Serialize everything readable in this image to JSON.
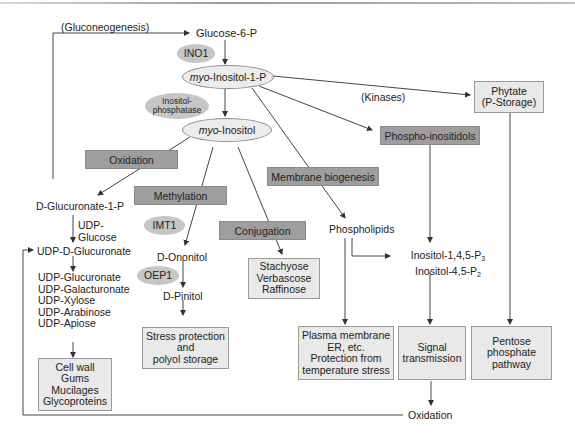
{
  "diagram": {
    "labels": {
      "gluconeogenesis": "(Gluconeogenesis)",
      "kinases": "(Kinases)"
    },
    "metabolites": {
      "glucose_6_p": "Glucose-6-P",
      "myo_inositol_1_p_prefix": "myo",
      "myo_inositol_1_p_suffix": "-Inositol-1-P",
      "myo_inositol_prefix": "myo",
      "myo_inositol_suffix": "-Inositol",
      "d_glucuronate_1_p": "D-Glucuronate-1-P",
      "udp_glucose_line1": "UDP-",
      "udp_glucose_line2": "Glucose",
      "udp_d_glucuronate": "UDP-D-Glucuronate",
      "udp_list": [
        "UDP-Glucuronate",
        "UDP-Galacturonate",
        "UDP-Xylose",
        "UDP-Arabinose",
        "UDP-Apiose"
      ],
      "d_ononitol": "D-Ononitol",
      "d_pinitol": "D-Pinitol",
      "phospholipids": "Phospholipids",
      "ip3_prefix": "Inositol-1,4,5-P",
      "ip3_sub": "3",
      "ip2_prefix": "Inositol-4,5-P",
      "ip2_sub": "2",
      "oxidation_end": "Oxidation"
    },
    "enzymes": {
      "ino1": "INO1",
      "inositol_phosphatase_line1": "Inositol-",
      "inositol_phosphatase_line2": "phosphatase",
      "imt1": "IMT1",
      "oep1": "OEP1"
    },
    "processes": {
      "oxidation": "Oxidation",
      "methylation": "Methylation",
      "conjugation": "Conjugation",
      "membrane_biogenesis": "Membrane biogenesis",
      "phospho_inositidols": "Phospho-inositidols"
    },
    "outcomes": {
      "phytate": [
        "Phytate",
        "(P-Storage)"
      ],
      "raffinose_family": [
        "Stachyose",
        "Verbascose",
        "Raffinose"
      ],
      "cell_wall": [
        "Cell wall",
        "Gums",
        "Mucilages",
        "Glycoproteins"
      ],
      "stress_protection": [
        "Stress protection",
        "and",
        "polyol storage"
      ],
      "plasma_membrane": [
        "Plasma membrane",
        "ER, etc.",
        "Protection from",
        "temperature stress"
      ],
      "signal_transmission": [
        "Signal",
        "transmission"
      ],
      "pentose_phosphate": [
        "Pentose",
        "phosphate",
        "pathway"
      ]
    },
    "colors": {
      "process_fill": "#9e9e9e",
      "outcome_fill": "#e9e9e9",
      "enzyme_fill": "#c6c6c6",
      "metabolite_ellipse_fill": "#ececec",
      "line": "#444444"
    }
  }
}
